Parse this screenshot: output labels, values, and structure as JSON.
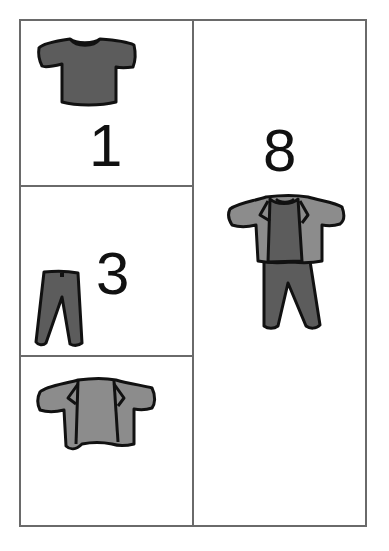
{
  "diagram": {
    "layout": "outfit combinations grid",
    "colors": {
      "border": "#6a6a6a",
      "dark_garment": "#5c5c5c",
      "light_garment": "#8c8c8c",
      "outline": "#111111"
    },
    "left_column": [
      {
        "item": "t-shirt",
        "icon": "tshirt-icon",
        "count": "1"
      },
      {
        "item": "pants",
        "icon": "pants-icon",
        "count": "3"
      },
      {
        "item": "jacket",
        "icon": "jacket-icon",
        "count": ""
      }
    ],
    "right_column": {
      "item": "full outfit (jacket over t-shirt with pants)",
      "icon": "outfit-icon",
      "count": "8"
    }
  }
}
